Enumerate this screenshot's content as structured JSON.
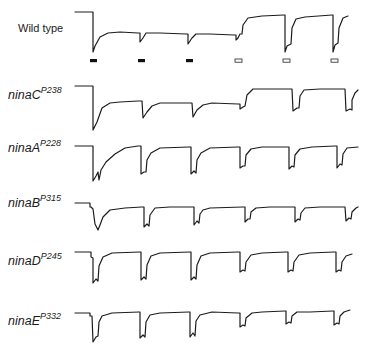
{
  "figure": {
    "rows": [
      {
        "id": "wild-type",
        "label": "Wild type",
        "superscript": "",
        "italic": false,
        "label_x": 18,
        "label_y": 22,
        "path": "M75,12 L93,12 L93,52 L95,46 L100,37 L108,33 L120,32 L138,33 L140,33 L140,42 L143,38 L146,33 L160,33 L186,34 L188,34 L188,44 L192,38 L196,34 L210,34 L234,35 L236,35 L236,40 L238,38 L240,34 L242,34 L243,25 L248,18 L262,16 L284,15 L285,15 L285,52 L287,46 L291,44 L292,28 L296,19 L305,17 L332,15 L333,15 L333,52 L335,45 L338,43 L339,28 L343,18 L348,16"
      },
      {
        "id": "ninaC",
        "label": "ninaC",
        "superscript": "P238",
        "italic": true,
        "label_x": 8,
        "label_y": 88,
        "path": "M75,86 L91,86 L93,86 L93,130 L97,122 L102,108 L110,103 L120,102 L138,101 L142,101 L143,118 L147,112 L152,106 L160,103 L190,103 L192,103 L193,117 L197,110 L203,105 L212,103 L238,104 L240,104 L240,109 L243,107 L245,106 L247,95 L253,89 L265,89 L290,89 L292,89 L293,111 L297,108 L299,108 L300,96 L304,90 L320,89 L344,89 L345,89 L346,111 L350,109 L352,110 L352,100 L355,93 L358,90"
      },
      {
        "id": "ninaA",
        "label": "ninaA",
        "superscript": "P228",
        "italic": true,
        "label_x": 8,
        "label_y": 141,
        "path": "M75,146 L91,146 L93,146 L93,181 L96,176 L98,172 L99,180 L101,170 L106,162 L115,154 L125,148 L138,146 L141,146 L141,174 L144,172 L146,172 L147,160 L151,153 L160,148 L189,147 L191,147 L191,174 L194,171 L196,173 L197,160 L201,153 L210,148 L238,147 L240,147 L240,168 L243,166 L245,166 L246,155 L251,149 L262,147 L287,147 L289,147 L289,169 L292,166 L294,167 L295,155 L300,149 L312,147 L335,146 L337,146 L337,168 L340,164 L342,165 L343,154 L347,148 L358,147"
      },
      {
        "id": "ninaB",
        "label": "ninaB",
        "superscript": "P315",
        "italic": true,
        "label_x": 8,
        "label_y": 196,
        "path": "M75,203 L88,203 L90,203 L90,207 L91,207 L93,209 L95,224 L98,230 L100,225 L103,217 L110,210 L125,208 L142,207 L144,207 L144,227 L147,224 L149,226 L150,215 L155,208 L170,207 L193,207 L194,207 L194,225 L197,221 L199,223 L200,214 L203,210 L210,208 L243,207 L245,207 L245,222 L248,219 L250,219 L251,212 L256,208 L270,207 L294,207 L295,207 L295,222 L298,219 L300,220 L301,213 L305,208 L320,207 L344,207 L345,207 L346,221 L349,218 L351,219 L352,212 L356,208 L358,207"
      },
      {
        "id": "ninaD",
        "label": "ninaD",
        "superscript": "P245",
        "italic": true,
        "label_x": 8,
        "label_y": 254,
        "path": "M75,252 L90,252 L91,252 L91,257 L93,258 L93,283 L96,279 L98,281 L99,266 L103,257 L112,253 L140,252 L141,252 L141,280 L144,277 L146,279 L147,265 L151,256 L160,253 L190,252 L191,252 L191,280 L194,277 L196,279 L197,265 L201,256 L210,253 L238,252 L240,252 L240,272 L243,270 L245,271 L246,262 L251,255 L262,253 L286,252 L288,252 L288,272 L291,270 L293,271 L294,262 L299,255 L310,253 L334,252 L336,252 L336,272 L339,270 L341,271 L342,262 L346,256 L352,254"
      },
      {
        "id": "ninaE",
        "label": "ninaE",
        "superscript": "P332",
        "italic": true,
        "label_x": 8,
        "label_y": 314,
        "path": "M75,313 L88,313 L90,313 L90,316 L92,316 L93,342 L96,337 L98,336 L99,322 L102,316 L112,313 L139,312 L140,312 L140,338 L143,335 L145,337 L146,322 L150,315 L160,313 L189,312 L190,312 L190,337 L193,333 L195,336 L196,321 L200,315 L212,312 L238,313 L240,313 L240,327 L243,325 L245,326 L246,318 L252,313 L262,312 L285,311 L286,311 L286,324 L289,322 L291,323 L292,316 L297,312 L310,312 L333,311 L334,311 L334,325 L337,323 L339,324 L340,316 L344,312 L350,310"
      }
    ],
    "stimulus_markers": {
      "y": 59,
      "items": [
        {
          "x": 90,
          "type": "filled"
        },
        {
          "x": 138,
          "type": "filled"
        },
        {
          "x": 186,
          "type": "filled"
        },
        {
          "x": 235,
          "type": "open"
        },
        {
          "x": 283,
          "type": "open"
        },
        {
          "x": 331,
          "type": "open"
        }
      ]
    }
  }
}
